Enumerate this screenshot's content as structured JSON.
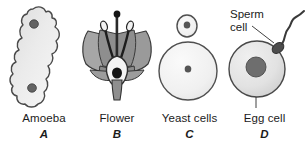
{
  "figure": {
    "background_color": "#ffffff",
    "outline_color": "#3c3c3c",
    "panels": [
      {
        "id": "a",
        "name": "Amoeba",
        "letter": "A",
        "icon": "amoeba-cell-icon",
        "description": "Irregular blob-shaped single cell with two dark nuclei",
        "fill_color": "#e8e8e8",
        "nucleus_color": "#5e5e5e",
        "nucleus_count": 2
      },
      {
        "id": "b",
        "name": "Flower",
        "letter": "B",
        "icon": "flower-cross-section-icon",
        "description": "Flower cross-section showing petals, stamens with anthers, pistil, ovary and ovule",
        "petal_color": "#a6a6a6",
        "ovary_fill_color": "#f2f2f2",
        "ovule_color": "#1d1d1d",
        "stamen_color": "#1d1d1d"
      },
      {
        "id": "c",
        "name": "Yeast cells",
        "letter": "C",
        "icon": "yeast-budding-cells-icon",
        "description": "Large round yeast cell with a small budding daughter cell, each with a nucleus",
        "fill_color": "#f0f0f0",
        "nucleus_color": "#5e5e5e",
        "cell_count": 2
      },
      {
        "id": "d",
        "name": "Egg cell",
        "letter": "D",
        "icon": "egg-and-sperm-icon",
        "description": "Round egg cell with large nucleus and a sperm cell with flagellum at its surface",
        "fill_color": "#e0e0e0",
        "nucleus_color": "#6b6b6b",
        "sperm_color": "#4a4a4a",
        "annotations": [
          {
            "id": "sperm",
            "label_line_1": "Sperm",
            "label_line_2": "cell",
            "leader": true
          },
          {
            "id": "egg",
            "label": "Egg cell",
            "leader": true
          }
        ]
      }
    ]
  }
}
